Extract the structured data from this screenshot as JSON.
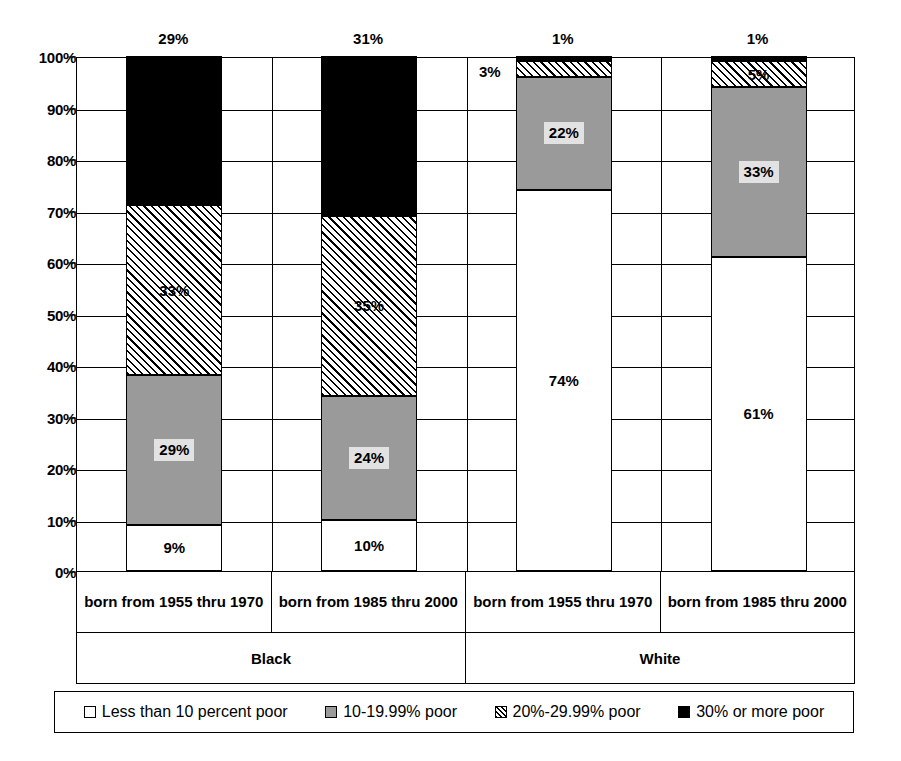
{
  "chart_data": {
    "type": "bar",
    "subtype": "stacked-bar-100",
    "title": "",
    "xlabel": "",
    "ylabel": "",
    "ylim": [
      0,
      100
    ],
    "grid": true,
    "legend_position": "bottom",
    "y_ticks": [
      "0%",
      "10%",
      "20%",
      "30%",
      "40%",
      "50%",
      "60%",
      "70%",
      "80%",
      "90%",
      "100%"
    ],
    "categories": [
      "born from 1955 thru 1970",
      "born from 1985 thru 2000",
      "born from 1955 thru 1970",
      "born from 1985 thru 2000"
    ],
    "groups": [
      "Black",
      "White"
    ],
    "series": [
      {
        "name": "Less than 10 percent poor",
        "fill": "white",
        "values": [
          9,
          10,
          74,
          61
        ],
        "labels": [
          "9%",
          "10%",
          "74%",
          "61%"
        ]
      },
      {
        "name": "10-19.99% poor",
        "fill": "gray",
        "values": [
          29,
          24,
          22,
          33
        ],
        "labels": [
          "29%",
          "24%",
          "22%",
          "33%"
        ]
      },
      {
        "name": "20%-29.99% poor",
        "fill": "hatch",
        "values": [
          33,
          35,
          3,
          5
        ],
        "labels": [
          "33%",
          "35%",
          "3%",
          "5%"
        ]
      },
      {
        "name": "30% or more poor",
        "fill": "black",
        "values": [
          29,
          31,
          1,
          1
        ],
        "labels": [
          "29%",
          "31%",
          "1%",
          "1%"
        ]
      }
    ],
    "colors": {
      "white": "#ffffff",
      "gray": "#9a9a9a",
      "hatch": "#ffffff",
      "black": "#000000",
      "outline": "#000000",
      "label_box": "#e2e2e2"
    }
  },
  "axis": {
    "y_labels": [
      "100%",
      "90%",
      "80%",
      "70%",
      "60%",
      "50%",
      "40%",
      "30%",
      "20%",
      "10%",
      "0%"
    ]
  },
  "category_axis": {
    "cells": [
      "born from 1955 thru 1970",
      "born from 1985 thru 2000",
      "born from 1955 thru 1970",
      "born from 1985 thru 2000"
    ],
    "groups": [
      "Black",
      "White"
    ]
  },
  "legend": {
    "items": [
      {
        "label": "Less than 10 percent poor",
        "swatch": "white"
      },
      {
        "label": "10-19.99% poor",
        "swatch": "gray"
      },
      {
        "label": "20%-29.99% poor",
        "swatch": "hatch"
      },
      {
        "label": "30% or more poor",
        "swatch": "black"
      }
    ]
  },
  "bar_labels": {
    "top": [
      "29%",
      "31%",
      "1%",
      "1%"
    ],
    "bar3_hatch_outside": "3%"
  }
}
